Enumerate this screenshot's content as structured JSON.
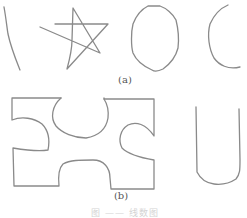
{
  "figure": {
    "panel_a": {
      "label": "(a)",
      "shapes": [
        "curved-line",
        "star",
        "ellipse",
        "open-arc"
      ]
    },
    "panel_b": {
      "label": "(b)",
      "shapes": [
        "puzzle-rectangle",
        "u-shape"
      ]
    },
    "caption": "图 ——   线数图",
    "colors": {
      "stroke": "#8a8a8a",
      "background": "#ffffff",
      "label": "#555555",
      "caption": "#d4d4d4"
    }
  }
}
